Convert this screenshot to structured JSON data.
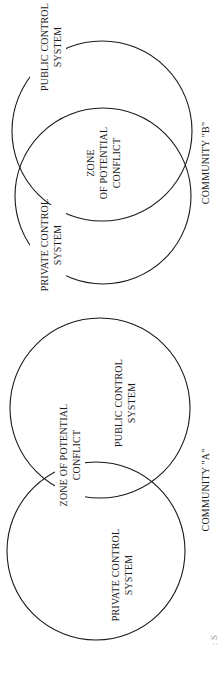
{
  "colors": {
    "ink": "#1a1a1a",
    "background": "#ffffff",
    "caption": "#9a9a9a"
  },
  "community_b": {
    "title": "COMMUNITY \"B\"",
    "public_label_line1": "PUBLIC CONTROL",
    "public_label_line2": "SYSTEM",
    "private_label_line1": "PRIVATE CONTROL",
    "private_label_line2": "SYSTEM",
    "zone_line1": "ZONE",
    "zone_line2": "OF POTENTIAL",
    "zone_line3": "CONFLICT"
  },
  "community_a": {
    "title": "COMMUNITY \"A\"",
    "public_label_line1": "PUBLIC CONTROL",
    "public_label_line2": "SYSTEM",
    "private_label_line1": "PRIVATE CONTROL",
    "private_label_line2": "SYSTEM",
    "zone_line1": "ZONE OF POTENTIAL",
    "zone_line2": "CONFLICT"
  },
  "caption_fragment": ": S"
}
